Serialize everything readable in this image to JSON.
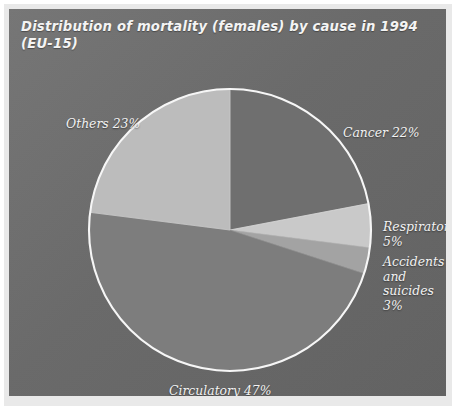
{
  "figure": {
    "title": "Distribution of mortality (females) by cause in 1994\n(EU-15)",
    "panel_color": "#6b6b6b",
    "outline_color": "#ffffff"
  },
  "chart_data": {
    "type": "pie",
    "title": "Distribution of mortality (females) by cause in 1994 (EU-15)",
    "subtitle": "",
    "xlabel": "",
    "ylabel": "",
    "units": "percent",
    "start_angle_deg": 0,
    "direction": "clockwise",
    "legend_position": "none",
    "labels_position": "outside",
    "grid": false,
    "categories": [
      "Cancer",
      "Respiratory",
      "Accidents and suicides",
      "Circulatory",
      "Others"
    ],
    "values": [
      22,
      5,
      3,
      47,
      23
    ],
    "colors": [
      "#6f6f6f",
      "#c9c9c9",
      "#a3a3a3",
      "#7d7d7d",
      "#bcbcbc"
    ],
    "slices": [
      {
        "name": "Cancer",
        "value": 22,
        "label": "Cancer 22%",
        "color": "#6f6f6f"
      },
      {
        "name": "Respiratory",
        "value": 5,
        "label": "Respiratory\n5%",
        "color": "#c9c9c9"
      },
      {
        "name": "Accidents and suicides",
        "value": 3,
        "label": "Accidents\nand suicides\n3%",
        "color": "#a3a3a3"
      },
      {
        "name": "Circulatory",
        "value": 47,
        "label": "Circulatory 47%",
        "color": "#7d7d7d"
      },
      {
        "name": "Others",
        "value": 23,
        "label": "Others 23%",
        "color": "#bcbcbc"
      }
    ]
  },
  "labels": {
    "cancer": "Cancer 22%",
    "others": "Others 23%",
    "respiratory": "Respiratory\n5%",
    "accidents": "Accidents\nand suicides\n3%",
    "circulatory": "Circulatory 47%"
  }
}
